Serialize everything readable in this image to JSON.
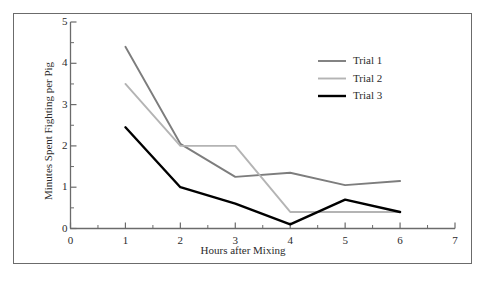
{
  "chart_data": {
    "type": "line",
    "title": "",
    "xlabel": "Hours after Mixing",
    "ylabel": "Minutes Spent Fighting per Pig",
    "x": [
      1,
      2,
      3,
      4,
      5,
      6
    ],
    "xlim": [
      0,
      7
    ],
    "ylim": [
      0,
      5
    ],
    "xticks": [
      "0",
      "1",
      "2",
      "3",
      "4",
      "5",
      "6",
      "7"
    ],
    "yticks": [
      "0",
      "1",
      "2",
      "3",
      "4",
      "5"
    ],
    "minor_ticks": true,
    "grid": false,
    "legend_position": "upper right",
    "series": [
      {
        "name": "Trial 1",
        "color": "#7d7d7d",
        "values": [
          4.4,
          2.05,
          1.25,
          1.35,
          1.05,
          1.15
        ]
      },
      {
        "name": "Trial 2",
        "color": "#b4b4b4",
        "values": [
          3.5,
          2.0,
          2.0,
          0.4,
          0.4,
          0.4
        ]
      },
      {
        "name": "Trial 3",
        "color": "#000000",
        "values": [
          2.45,
          1.0,
          0.6,
          0.1,
          0.7,
          0.4
        ]
      }
    ]
  },
  "legend": {
    "items": [
      {
        "label": "Trial 1"
      },
      {
        "label": "Trial 2"
      },
      {
        "label": "Trial 3"
      }
    ]
  },
  "axes": {
    "x_tick_labels": [
      "0",
      "1",
      "2",
      "3",
      "4",
      "5",
      "6",
      "7"
    ],
    "y_tick_labels": [
      "0",
      "1",
      "2",
      "3",
      "4",
      "5"
    ],
    "x_axis_title": "Hours after Mixing",
    "y_axis_title": "Minutes Spent Fighting per Pig"
  },
  "colors": {
    "axis": "#6b6b6b",
    "frame": "#6b6b6b",
    "text": "#2b2b2b",
    "trial1": "#7d7d7d",
    "trial2": "#b4b4b4",
    "trial3": "#000000",
    "background": "#ffffff"
  }
}
